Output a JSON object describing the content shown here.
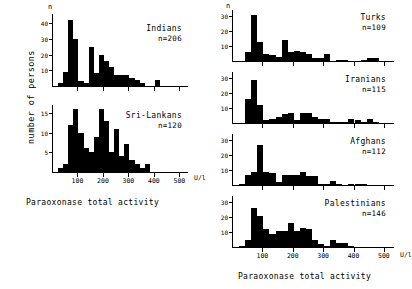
{
  "figure": {
    "y_axis_label": "number of persons",
    "x_axis_caption_left": "Paraoxonase total activity",
    "x_axis_caption_right": "Paraoxonase total activity",
    "x_unit": "U/l",
    "n_symbol": "n",
    "x_ticks": [
      "100",
      "200",
      "300",
      "400",
      "500"
    ],
    "ink_color": "#000000",
    "background_color": "#ffffff"
  },
  "chart_data": {
    "type": "bar",
    "xlabel": "Paraoxonase total activity",
    "ylabel": "number of persons",
    "x_unit": "U/l",
    "xlim": [
      0,
      530
    ],
    "grid": false,
    "legend": "none",
    "bin_width": 20,
    "panels": [
      {
        "name": "Indians",
        "label": "Indians",
        "n_label": "n=206",
        "n": 206,
        "column": "left",
        "ylim": [
          0,
          46
        ],
        "yticks": [
          10,
          20,
          30,
          40
        ],
        "bin_starts": [
          20,
          40,
          60,
          80,
          100,
          120,
          140,
          160,
          180,
          200,
          220,
          240,
          260,
          280,
          300,
          320,
          340,
          360,
          380,
          400,
          420,
          440,
          460,
          480,
          500
        ],
        "values": [
          2,
          9,
          42,
          30,
          3,
          2,
          25,
          8,
          20,
          16,
          12,
          7,
          7,
          7,
          5,
          4,
          2,
          0,
          0,
          4,
          0,
          0,
          0,
          0,
          0
        ]
      },
      {
        "name": "Sri-Lankans",
        "label": "Sri-Lankans",
        "n_label": "n=120",
        "n": 120,
        "column": "left",
        "ylim": [
          0,
          17
        ],
        "yticks": [
          5,
          10,
          15
        ],
        "bin_starts": [
          20,
          40,
          60,
          80,
          100,
          120,
          140,
          160,
          180,
          200,
          220,
          240,
          260,
          280,
          300,
          320,
          340,
          360,
          380,
          400,
          420,
          440,
          460,
          480,
          500
        ],
        "values": [
          1,
          2,
          12,
          16,
          10,
          6,
          5,
          9,
          16,
          13,
          5,
          11,
          4,
          7,
          3,
          2,
          1,
          2,
          0,
          0,
          0,
          0,
          0,
          0,
          0
        ]
      },
      {
        "name": "Turks",
        "label": "Turks",
        "n_label": "n=109",
        "n": 109,
        "column": "right",
        "ylim": [
          0,
          34
        ],
        "yticks": [
          10,
          20,
          30
        ],
        "bin_starts": [
          20,
          40,
          60,
          80,
          100,
          120,
          140,
          160,
          180,
          200,
          220,
          240,
          260,
          280,
          300,
          320,
          340,
          360,
          380,
          400,
          420,
          440,
          460,
          480,
          500
        ],
        "values": [
          0,
          6,
          31,
          13,
          5,
          4,
          3,
          14,
          6,
          7,
          6,
          5,
          2,
          2,
          5,
          0,
          1,
          1,
          0,
          0,
          1,
          2,
          2,
          0,
          0
        ]
      },
      {
        "name": "Iranians",
        "label": "Iranians",
        "n_label": "n=115",
        "n": 115,
        "column": "right",
        "ylim": [
          0,
          34
        ],
        "yticks": [
          10,
          20,
          30
        ],
        "bin_starts": [
          20,
          40,
          60,
          80,
          100,
          120,
          140,
          160,
          180,
          200,
          220,
          240,
          260,
          280,
          300,
          320,
          340,
          360,
          380,
          400,
          420,
          440,
          460,
          480,
          500
        ],
        "values": [
          0,
          16,
          29,
          12,
          2,
          3,
          4,
          6,
          7,
          2,
          7,
          7,
          4,
          3,
          3,
          1,
          1,
          1,
          3,
          2,
          1,
          3,
          1,
          0,
          0
        ]
      },
      {
        "name": "Afghans",
        "label": "Afghans",
        "n_label": "n=112",
        "n": 112,
        "column": "right",
        "ylim": [
          0,
          34
        ],
        "yticks": [
          10,
          20,
          30
        ],
        "bin_starts": [
          20,
          40,
          60,
          80,
          100,
          120,
          140,
          160,
          180,
          200,
          220,
          240,
          260,
          280,
          300,
          320,
          340,
          360,
          380,
          400,
          420,
          440,
          460,
          480,
          500
        ],
        "values": [
          1,
          7,
          9,
          27,
          9,
          8,
          2,
          7,
          7,
          7,
          9,
          6,
          6,
          1,
          1,
          3,
          1,
          0,
          1,
          1,
          1,
          0,
          0,
          0,
          0
        ]
      },
      {
        "name": "Palestinians",
        "label": "Palestinians",
        "n_label": "n=146",
        "n": 146,
        "column": "right",
        "ylim": [
          0,
          34
        ],
        "yticks": [
          10,
          20,
          30
        ],
        "bin_starts": [
          20,
          40,
          60,
          80,
          100,
          120,
          140,
          160,
          180,
          200,
          220,
          240,
          260,
          280,
          300,
          320,
          340,
          360,
          380,
          400,
          420,
          440,
          460,
          480,
          500
        ],
        "values": [
          1,
          5,
          26,
          21,
          12,
          9,
          11,
          11,
          16,
          11,
          13,
          12,
          5,
          2,
          1,
          5,
          3,
          3,
          1,
          0,
          0,
          0,
          0,
          0,
          0
        ]
      }
    ]
  }
}
